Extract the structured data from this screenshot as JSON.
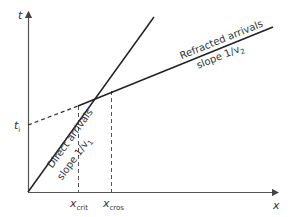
{
  "diagram": {
    "axes": {
      "y_label": "t",
      "x_label": "x"
    },
    "intercept_label": {
      "main": "t",
      "sub": "i"
    },
    "x_markers": [
      {
        "main": "x",
        "sub": "crit"
      },
      {
        "main": "x",
        "sub": "cros"
      }
    ],
    "lines": {
      "direct": {
        "label": "Direct arrivals",
        "slope_main": "slope 1/v",
        "slope_sub": "1"
      },
      "refracted": {
        "label": "Refracted arrivals",
        "slope_main": "slope 1/v",
        "slope_sub": "2"
      }
    },
    "colors": {
      "line": "#222222",
      "axis": "#444444",
      "dashed": "#444444"
    }
  }
}
